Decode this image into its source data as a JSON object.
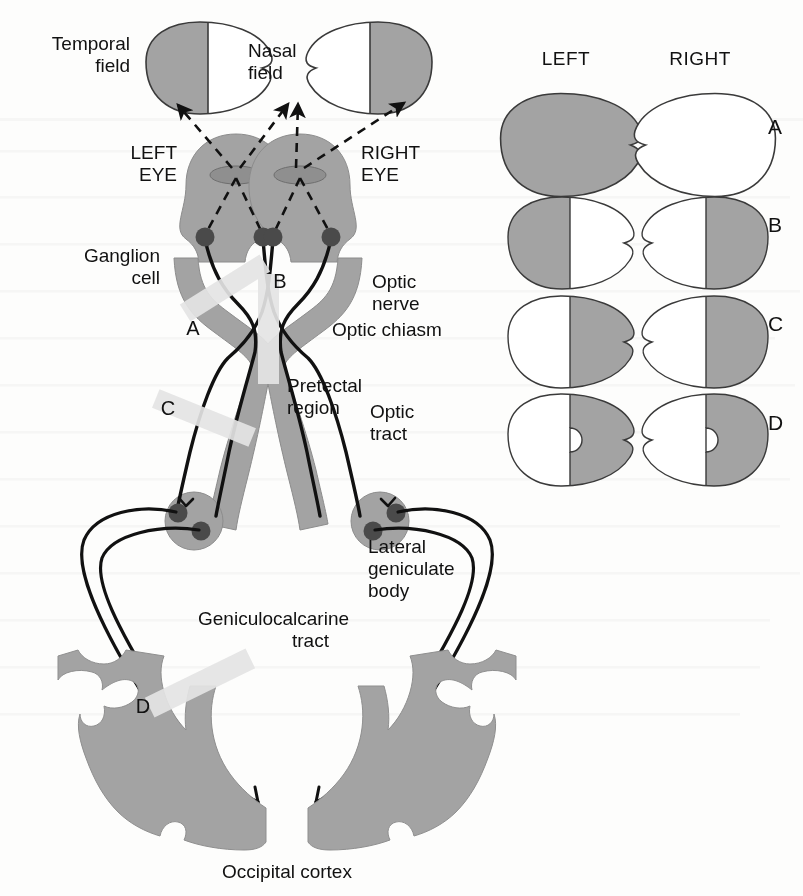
{
  "figure": {
    "gray_fill": "#a3a3a3",
    "outline": "#3a3a3a",
    "lesion_bar_color": "#e2e2e2",
    "background": "#fdfdfc",
    "text_color": "#111111"
  },
  "labels": {
    "temporal_field_line1": "Temporal",
    "temporal_field_line2": "field",
    "nasal_field_line1": "Nasal",
    "nasal_field_line2": "field",
    "left_eye_line1": "LEFT",
    "left_eye_line2": "EYE",
    "right_eye_line1": "RIGHT",
    "right_eye_line2": "EYE",
    "ganglion_cell_line1": "Ganglion",
    "ganglion_cell_line2": "cell",
    "optic_nerve_line1": "Optic",
    "optic_nerve_line2": "nerve",
    "optic_chiasm": "Optic chiasm",
    "pretectal_line1": "Pretectal",
    "pretectal_line2": "region",
    "optic_tract_line1": "Optic",
    "optic_tract_line2": "tract",
    "lgb_line1": "Lateral",
    "lgb_line2": "geniculate",
    "lgb_line3": "body",
    "genicu_line1": "Geniculocalcarine",
    "genicu_line2": "tract",
    "occipital_cortex": "Occipital cortex"
  },
  "lesions": [
    {
      "id": "A",
      "label": "A",
      "location": "left optic nerve",
      "letter_x": 193,
      "letter_y": 328
    },
    {
      "id": "B",
      "label": "B",
      "location": "optic chiasm",
      "letter_x": 278,
      "letter_y": 282
    },
    {
      "id": "C",
      "label": "C",
      "location": "left optic tract",
      "letter_x": 168,
      "letter_y": 410
    },
    {
      "id": "D",
      "label": "D",
      "location": "left geniculocalcarine tract",
      "letter_x": 143,
      "letter_y": 706
    }
  ],
  "field_panel": {
    "header_left": "LEFT",
    "header_right": "RIGHT",
    "rows": [
      {
        "letter": "A",
        "defect": "total blindness left eye",
        "left": {
          "shading": "full",
          "macular_sparing": false
        },
        "right": {
          "shading": "none",
          "macular_sparing": false
        }
      },
      {
        "letter": "B",
        "defect": "bitemporal hemianopia",
        "left": {
          "shading": "left-half",
          "macular_sparing": false
        },
        "right": {
          "shading": "right-half",
          "macular_sparing": false
        }
      },
      {
        "letter": "C",
        "defect": "right homonymous hemianopia",
        "left": {
          "shading": "right-half",
          "macular_sparing": false
        },
        "right": {
          "shading": "right-half",
          "macular_sparing": false
        }
      },
      {
        "letter": "D",
        "defect": "right homonymous hemianopia with macular sparing",
        "left": {
          "shading": "right-half",
          "macular_sparing": true
        },
        "right": {
          "shading": "right-half",
          "macular_sparing": true
        }
      }
    ]
  },
  "eyes": {
    "left": {
      "field_shading": "left-half",
      "ganglion_cells": 2
    },
    "right": {
      "field_shading": "right-half",
      "ganglion_cells": 2
    }
  }
}
